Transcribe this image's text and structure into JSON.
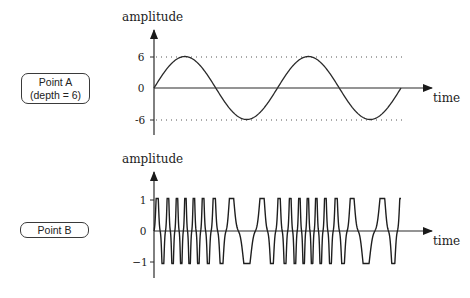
{
  "panels": [
    {
      "id": "point-a",
      "box_label_line1": "Point A",
      "box_label_line2": "(depth = 6)",
      "y_axis_label": "amplitude",
      "x_axis_label": "time",
      "ticks": [
        "6",
        "0",
        "-6"
      ]
    },
    {
      "id": "point-b",
      "box_label_line1": "Point B",
      "y_axis_label": "amplitude",
      "x_axis_label": "time",
      "ticks": [
        "1",
        "0",
        "−1"
      ]
    }
  ],
  "chart_data": [
    {
      "type": "line",
      "title": "Point A (depth = 6)",
      "xlabel": "time",
      "ylabel": "amplitude",
      "ylim": [
        -6,
        6
      ],
      "yticks": [
        6,
        0,
        -6
      ],
      "reference_lines": [
        6,
        -6
      ],
      "series": [
        {
          "name": "modulating sine",
          "cycles": 2,
          "amplitude": 6,
          "phase": "starts at 0, rising"
        }
      ]
    },
    {
      "type": "line",
      "title": "Point B",
      "xlabel": "time",
      "ylabel": "amplitude",
      "ylim": [
        -1,
        1
      ],
      "yticks": [
        1,
        0,
        -1
      ],
      "series": [
        {
          "name": "frequency-modulated carrier",
          "amplitude": 1,
          "peaks_count": 18,
          "note": "instantaneous frequency follows Point A signal; clipped-top 'M/W' shaped peaks"
        }
      ]
    }
  ],
  "colors": {
    "line": "#2a2a2a",
    "text": "#222222",
    "background": "#ffffff"
  }
}
